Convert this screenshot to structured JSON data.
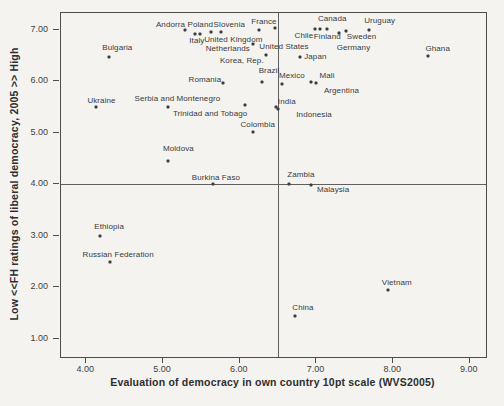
{
  "figure": {
    "background": "#f4f3f0",
    "frame_color": "#4d4d4d",
    "dot_color": "#3c3c3c",
    "refline_color": "#5f5f5f"
  },
  "chart_data": {
    "type": "scatter",
    "title": "",
    "xlabel": "Evaluation of democracy in own country 10pt scale (WVS2005)",
    "ylabel": "Low <<FH ratings of liberal democracy, 2005 >> High",
    "xlim": [
      3.67,
      9.21
    ],
    "ylim": [
      0.65,
      7.33
    ],
    "grid": false,
    "reference_lines": {
      "x": 6.5,
      "y": 4.0
    },
    "x_ticks": [
      {
        "value": 4,
        "label": "4.00"
      },
      {
        "value": 5,
        "label": "5.00"
      },
      {
        "value": 6,
        "label": "6.00"
      },
      {
        "value": 7,
        "label": "7.00"
      },
      {
        "value": 8,
        "label": "8.00"
      },
      {
        "value": 9,
        "label": "9.00"
      }
    ],
    "y_ticks": [
      {
        "value": 1,
        "label": "1.00"
      },
      {
        "value": 2,
        "label": "2.00"
      },
      {
        "value": 3,
        "label": "3.00"
      },
      {
        "value": 4,
        "label": "4.00"
      },
      {
        "value": 5,
        "label": "5.00"
      },
      {
        "value": 6,
        "label": "6.00"
      },
      {
        "value": 7,
        "label": "7.00"
      }
    ],
    "points": [
      {
        "name": "Ukraine",
        "x": 4.12,
        "y": 5.5,
        "dx": 6,
        "dy": -6
      },
      {
        "name": "Bulgaria",
        "x": 4.3,
        "y": 6.48,
        "dx": 8,
        "dy": -9
      },
      {
        "name": "Ethiopia",
        "x": 4.18,
        "y": 3.0,
        "dx": 9,
        "dy": -9
      },
      {
        "name": "Russian Federation",
        "x": 4.31,
        "y": 2.5,
        "dx": 8,
        "dy": -7
      },
      {
        "name": "Serbia and Montenegro",
        "x": 5.07,
        "y": 5.5,
        "dx": 9,
        "dy": -8
      },
      {
        "name": "Moldova",
        "x": 5.07,
        "y": 4.46,
        "dx": 10,
        "dy": -12
      },
      {
        "name": "Andorra",
        "x": 5.28,
        "y": 7.0,
        "dx": -14,
        "dy": -5
      },
      {
        "name": "Poland",
        "x": 5.42,
        "y": 6.93,
        "dx": 5,
        "dy": -9
      },
      {
        "name": "Italy",
        "x": 5.48,
        "y": 6.92,
        "dx": -3,
        "dy": 7
      },
      {
        "name": "Slovenia",
        "x": 5.63,
        "y": 6.96,
        "dx": 18,
        "dy": -7
      },
      {
        "name": "United Kingdom",
        "x": 5.76,
        "y": 6.96,
        "dx": 12,
        "dy": 8
      },
      {
        "name": "Romania",
        "x": 5.78,
        "y": 5.97,
        "dx": -18,
        "dy": -3
      },
      {
        "name": "Burkina Faso",
        "x": 5.65,
        "y": 4.0,
        "dx": 3,
        "dy": -6
      },
      {
        "name": "Netherlands",
        "x": 6.17,
        "y": 6.73,
        "dx": -25,
        "dy": 5
      },
      {
        "name": "France",
        "x": 6.25,
        "y": 7.0,
        "dx": 5,
        "dy": -8
      },
      {
        "name": "United States",
        "x": 6.46,
        "y": 7.03,
        "dx": 9,
        "dy": 19
      },
      {
        "name": "Korea, Rep.",
        "x": 6.34,
        "y": 6.51,
        "dx": -24,
        "dy": 6
      },
      {
        "name": "Brazil",
        "x": 6.29,
        "y": 5.99,
        "dx": 7,
        "dy": -11
      },
      {
        "name": "Trinidad and Tobago",
        "x": 6.07,
        "y": 5.54,
        "dx": -35,
        "dy": 9
      },
      {
        "name": "Colombia",
        "x": 6.17,
        "y": 5.02,
        "dx": 5,
        "dy": -7
      },
      {
        "name": "India",
        "x": 6.47,
        "y": 5.5,
        "dx": 11,
        "dy": -5
      },
      {
        "name": "Indonesia",
        "x": 6.5,
        "y": 5.46,
        "dx": 36,
        "dy": 6
      },
      {
        "name": "Mexico",
        "x": 6.55,
        "y": 5.95,
        "dx": 10,
        "dy": -8
      },
      {
        "name": "Japan",
        "x": 6.79,
        "y": 6.48,
        "dx": 15,
        "dy": 0
      },
      {
        "name": "Mali",
        "x": 6.93,
        "y": 5.99,
        "dx": 16,
        "dy": -6
      },
      {
        "name": "Argentina",
        "x": 7.0,
        "y": 5.97,
        "dx": 25,
        "dy": 8
      },
      {
        "name": "Chile",
        "x": 6.98,
        "y": 7.02,
        "dx": -11,
        "dy": 7
      },
      {
        "name": "Finland",
        "x": 7.05,
        "y": 7.02,
        "dx": 7,
        "dy": 8
      },
      {
        "name": "Canada",
        "x": 7.14,
        "y": 7.02,
        "dx": 5,
        "dy": -10
      },
      {
        "name": "Germany",
        "x": 7.3,
        "y": 6.95,
        "dx": 14,
        "dy": 15
      },
      {
        "name": "Sweden",
        "x": 7.38,
        "y": 6.98,
        "dx": 16,
        "dy": 6
      },
      {
        "name": "Uruguay",
        "x": 7.68,
        "y": 7.0,
        "dx": 11,
        "dy": -9
      },
      {
        "name": "Ghana",
        "x": 8.45,
        "y": 6.5,
        "dx": 10,
        "dy": -7
      },
      {
        "name": "Zambia",
        "x": 6.64,
        "y": 4.01,
        "dx": 12,
        "dy": -9
      },
      {
        "name": "Malaysia",
        "x": 6.93,
        "y": 3.99,
        "dx": 22,
        "dy": 5
      },
      {
        "name": "China",
        "x": 6.72,
        "y": 1.45,
        "dx": 8,
        "dy": -8
      },
      {
        "name": "Vietnam",
        "x": 7.93,
        "y": 1.95,
        "dx": 9,
        "dy": -7
      }
    ]
  }
}
